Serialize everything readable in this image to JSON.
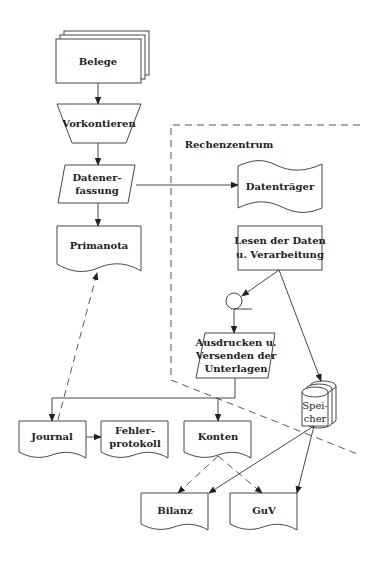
{
  "diagram": {
    "type": "flowchart",
    "region_label": "Rechenzentrum",
    "nodes": {
      "belege": {
        "label": "Belege",
        "shape": "multi-document"
      },
      "vorkontieren": {
        "label": "Vorkontieren",
        "shape": "manual-operation"
      },
      "datenerfassung": {
        "line1": "Datener-",
        "line2": "fassung",
        "shape": "input-output"
      },
      "primanota": {
        "label": "Primanota",
        "shape": "document"
      },
      "datentraeger": {
        "label": "Datenträger",
        "shape": "punched-tape"
      },
      "lesen": {
        "line1": "Lesen der Daten",
        "line2": "u. Verarbeitung",
        "shape": "process"
      },
      "ausdrucken": {
        "line1": "Ausdrucken u.",
        "line2": "Versenden der",
        "line3": "Unterlagen",
        "shape": "input-output"
      },
      "speicher": {
        "line1": "Spei-",
        "line2": "cher",
        "shape": "disk-storage"
      },
      "journal": {
        "label": "Journal",
        "shape": "document"
      },
      "fehlerprotokoll": {
        "line1": "Fehler-",
        "line2": "protokoll",
        "shape": "document"
      },
      "konten": {
        "label": "Konten",
        "shape": "document"
      },
      "bilanz": {
        "label": "Bilanz",
        "shape": "document"
      },
      "guv": {
        "label": "GuV",
        "shape": "document"
      }
    },
    "edges": [
      {
        "from": "Belege",
        "to": "Vorkontieren",
        "style": "solid"
      },
      {
        "from": "Vorkontieren",
        "to": "Datenerfassung",
        "style": "solid"
      },
      {
        "from": "Datenerfassung",
        "to": "Primanota",
        "style": "solid"
      },
      {
        "from": "Datenerfassung",
        "to": "Datenträger",
        "style": "solid"
      },
      {
        "from": "Lesen der Daten u. Verarbeitung",
        "to": "Connector",
        "style": "solid"
      },
      {
        "from": "Lesen der Daten u. Verarbeitung",
        "to": "Speicher",
        "style": "solid"
      },
      {
        "from": "Connector",
        "to": "Ausdrucken u. Versenden der Unterlagen",
        "style": "solid"
      },
      {
        "from": "Ausdrucken u. Versenden der Unterlagen",
        "to": "Journal",
        "style": "solid"
      },
      {
        "from": "Ausdrucken u. Versenden der Unterlagen",
        "to": "Konten",
        "style": "solid"
      },
      {
        "from": "Journal",
        "to": "Primanota",
        "style": "dashed"
      },
      {
        "from": "Journal",
        "to": "Fehlerprotokoll",
        "style": "solid"
      },
      {
        "from": "Konten",
        "to": "Bilanz",
        "style": "dashed"
      },
      {
        "from": "Konten",
        "to": "GuV",
        "style": "dashed"
      },
      {
        "from": "Speicher",
        "to": "Bilanz",
        "style": "solid"
      },
      {
        "from": "Speicher",
        "to": "GuV",
        "style": "solid"
      }
    ]
  }
}
